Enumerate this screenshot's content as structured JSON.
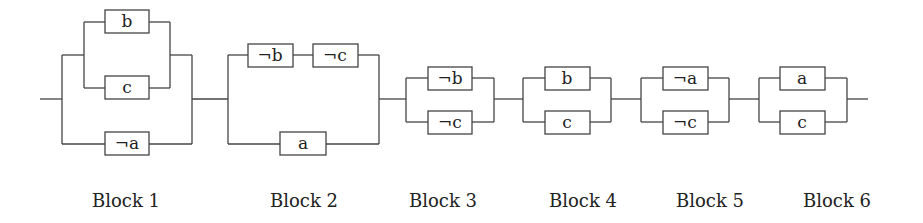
{
  "diagram": {
    "type": "series-parallel-circuit",
    "colors": {
      "line": "#444444",
      "text": "#222222",
      "background": "#ffffff"
    },
    "blocks": [
      {
        "id": 1,
        "label": "Block 1",
        "structure": "parallel( parallel(b, c), ¬a )",
        "literals": [
          "b",
          "c",
          "¬a"
        ]
      },
      {
        "id": 2,
        "label": "Block 2",
        "structure": "parallel( series(¬b, ¬c), a )",
        "literals": [
          "¬b",
          "¬c",
          "a"
        ]
      },
      {
        "id": 3,
        "label": "Block 3",
        "structure": "parallel(¬b, ¬c)",
        "literals": [
          "¬b",
          "¬c"
        ]
      },
      {
        "id": 4,
        "label": "Block 4",
        "structure": "parallel(b, c)",
        "literals": [
          "b",
          "c"
        ]
      },
      {
        "id": 5,
        "label": "Block 5",
        "structure": "parallel(¬a, ¬c)",
        "literals": [
          "¬a",
          "¬c"
        ]
      },
      {
        "id": 6,
        "label": "Block 6",
        "structure": "parallel(a, c)",
        "literals": [
          "a",
          "c"
        ]
      }
    ]
  }
}
